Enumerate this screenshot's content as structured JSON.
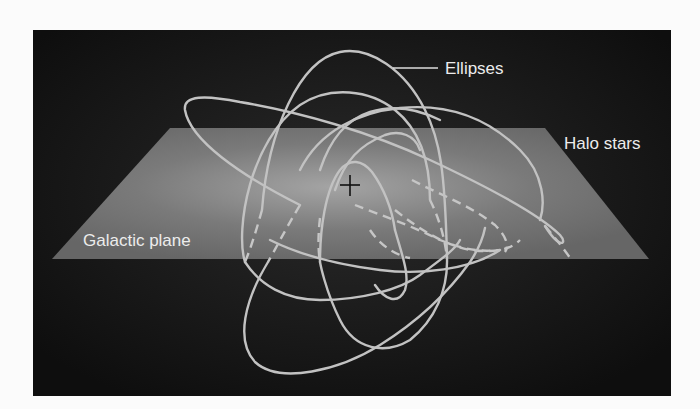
{
  "figure": {
    "labels": {
      "ellipses": "Ellipses",
      "halo_stars": "Halo stars",
      "galactic_plane": "Galactic plane"
    },
    "center_marker": "galactic-center-crosshair",
    "colors": {
      "page_background": "#fbfbfb",
      "panel_background": "#121212",
      "plane_fill": "#6e6e6e",
      "plane_glow": "#9a9a9a",
      "orbit_stroke": "#c2c2c2",
      "label_text": "#ececec",
      "crosshair": "#111111"
    }
  }
}
